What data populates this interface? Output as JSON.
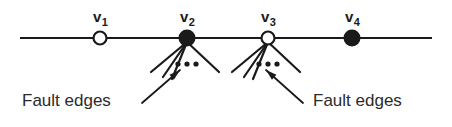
{
  "figure": {
    "type": "path-graph-with-fault-edges-diagram",
    "background_color": "#ffffff",
    "stroke_color": "#1a1a1a",
    "text_color": "#2b2b2b",
    "canvas": {
      "width": 452,
      "height": 127
    }
  },
  "backbone": {
    "name": "horizontal-path-line",
    "x1": 20,
    "x2": 432,
    "y": 38,
    "stroke_width": 2.2
  },
  "vertices": [
    {
      "id": "v1",
      "label_base": "v",
      "label_sub": "1",
      "fill": "hollow",
      "cx": 100,
      "cy": 38,
      "r": 6.5,
      "label_x": 93,
      "label_y": 22,
      "has_fault_edges": false
    },
    {
      "id": "v2",
      "label_base": "v",
      "label_sub": "2",
      "fill": "solid",
      "cx": 187,
      "cy": 38,
      "r": 7.5,
      "label_x": 180,
      "label_y": 22,
      "has_fault_edges": true
    },
    {
      "id": "v3",
      "label_base": "v",
      "label_sub": "3",
      "fill": "hollow",
      "cx": 268,
      "cy": 38,
      "r": 6.5,
      "label_x": 261,
      "label_y": 22,
      "has_fault_edges": true
    },
    {
      "id": "v4",
      "label_base": "v",
      "label_sub": "4",
      "fill": "solid",
      "cx": 352,
      "cy": 38,
      "r": 7.5,
      "label_x": 345,
      "label_y": 22,
      "has_fault_edges": false
    }
  ],
  "fault_edge_fans": [
    {
      "name": "fault-edge-fan-v2",
      "origin_x": 187,
      "origin_y": 42,
      "stroke_width": 2.2,
      "edges": [
        {
          "x2": 151,
          "y2": 72
        },
        {
          "x2": 163,
          "y2": 77
        },
        {
          "x2": 172,
          "y2": 79
        },
        {
          "x2": 219,
          "y2": 72
        }
      ],
      "ellipsis": {
        "cx": 187,
        "cy": 64,
        "dot_r": 2.6,
        "gap": 9,
        "count": 3
      }
    },
    {
      "name": "fault-edge-fan-v3",
      "origin_x": 268,
      "origin_y": 42,
      "stroke_width": 2.2,
      "edges": [
        {
          "x2": 232,
          "y2": 72
        },
        {
          "x2": 244,
          "y2": 77
        },
        {
          "x2": 253,
          "y2": 79
        },
        {
          "x2": 300,
          "y2": 72
        }
      ],
      "ellipsis": {
        "cx": 268,
        "cy": 64,
        "dot_r": 2.6,
        "gap": 9,
        "count": 3
      }
    }
  ],
  "annotations": [
    {
      "name": "fault-edges-label-left",
      "text": "Fault edges",
      "text_x": 22,
      "text_y": 106,
      "anchor": "start",
      "arrow": {
        "name": "fault-edges-arrow-left",
        "x1": 142,
        "y1": 103,
        "x2": 180,
        "y2": 70,
        "stroke_width": 1.8,
        "head_size": 11
      }
    },
    {
      "name": "fault-edges-label-right",
      "text": "Fault edges",
      "text_x": 313,
      "text_y": 106,
      "anchor": "start",
      "arrow": {
        "name": "fault-edges-arrow-right",
        "x1": 303,
        "y1": 103,
        "x2": 266,
        "y2": 70,
        "stroke_width": 1.8,
        "head_size": 11
      }
    }
  ]
}
